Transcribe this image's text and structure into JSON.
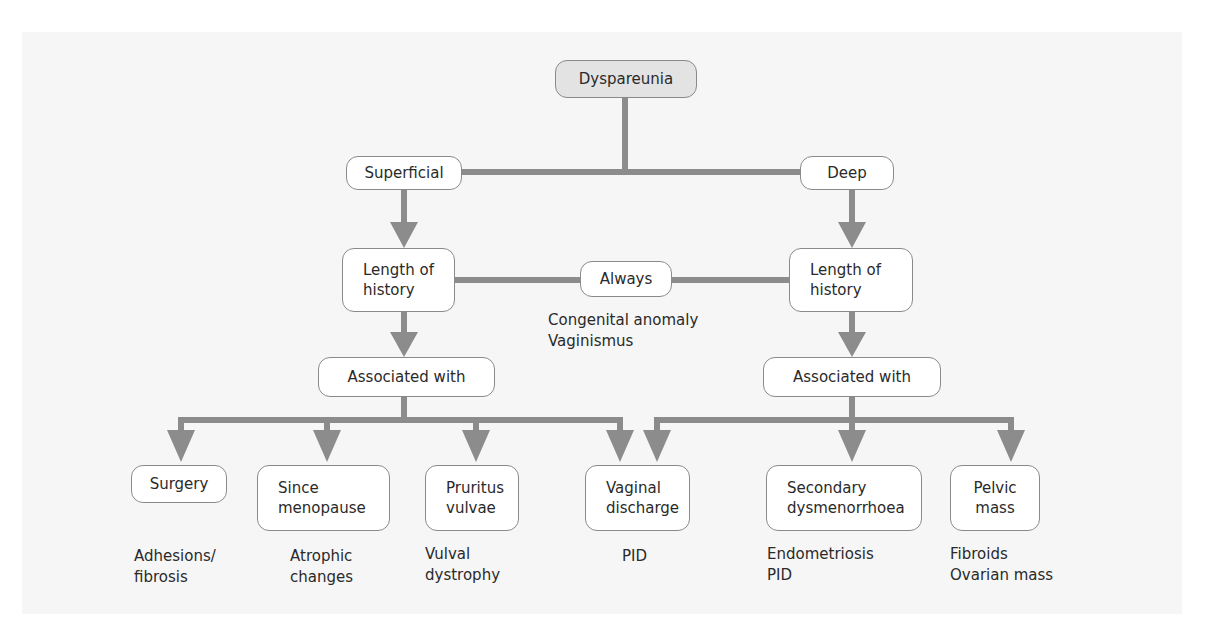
{
  "diagram": {
    "root": "Dyspareunia",
    "branches": {
      "superficial": "Superficial",
      "deep": "Deep"
    },
    "length_left": "Length of\nhistory",
    "length_right": "Length of\nhistory",
    "always": "Always",
    "always_causes": "Congenital anomaly\nVaginismus",
    "associated_left": "Associated with",
    "associated_right": "Associated with",
    "outcomes": [
      {
        "label": "Surgery",
        "causes": "Adhesions/\nfibrosis"
      },
      {
        "label": "Since\nmenopause",
        "causes": "Atrophic\nchanges"
      },
      {
        "label": "Pruritus\nvulvae",
        "causes": "Vulval\ndystrophy"
      },
      {
        "label": "Vaginal\ndischarge",
        "causes": "PID"
      },
      {
        "label": "Secondary\ndysmenorrhoea",
        "causes": "Endometriosis\nPID"
      },
      {
        "label": "Pelvic\nmass",
        "causes": "Fibroids\nOvarian mass"
      }
    ],
    "colors": {
      "connector": "#8c8c8c",
      "root_fill": "#e3e3e3",
      "node_border": "#8a8a8a",
      "background": "#f6f6f6"
    }
  }
}
